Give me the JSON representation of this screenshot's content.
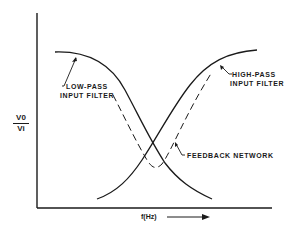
{
  "diagram": {
    "y_axis_label": {
      "numerator": "V0",
      "denominator": "Vi"
    },
    "x_axis_label": "f(Hz)",
    "curves": [
      {
        "name": "low-pass",
        "label_line1": "LOW-PASS",
        "label_line2": "INPUT FILTER",
        "style": "solid"
      },
      {
        "name": "high-pass",
        "label_line1": "HIGH-PASS",
        "label_line2": "INPUT FILTER",
        "style": "solid"
      },
      {
        "name": "feedback",
        "label": "FEEDBACK NETWORK",
        "style": "dashed"
      }
    ],
    "colors": {
      "ink": "#1a1a1a",
      "background": "#ffffff"
    }
  }
}
